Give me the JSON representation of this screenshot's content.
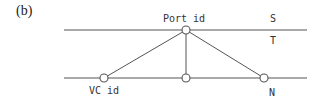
{
  "panel_label": "(b)",
  "colors": {
    "line": "#555555",
    "node_fill": "#ffffff",
    "text": "#333333"
  },
  "lines": {
    "top": {
      "y": 30,
      "x1": 64,
      "x2": 307
    },
    "bottom": {
      "y": 78,
      "x1": 64,
      "x2": 307
    }
  },
  "nodes": [
    {
      "id": "port",
      "cx": 186,
      "cy": 30,
      "label": "Port id"
    },
    {
      "id": "vc",
      "cx": 104,
      "cy": 78,
      "label": "VC id"
    },
    {
      "id": "mid",
      "cx": 186,
      "cy": 78,
      "label": ""
    },
    {
      "id": "n",
      "cx": 264,
      "cy": 78,
      "label": "N"
    }
  ],
  "edges": [
    {
      "from": "port",
      "to": "vc"
    },
    {
      "from": "port",
      "to": "mid"
    },
    {
      "from": "port",
      "to": "n"
    }
  ],
  "side_labels": {
    "s": "S",
    "t": "T"
  }
}
